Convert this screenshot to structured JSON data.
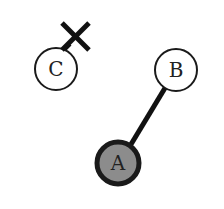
{
  "diagram": {
    "nodes": [
      {
        "id": "C",
        "label": "C",
        "cx": 56,
        "cy": 69,
        "r": 22,
        "fill": "#ffffff",
        "stroke": "#1a1a1a",
        "stroke_width": 2
      },
      {
        "id": "B",
        "label": "B",
        "cx": 176,
        "cy": 70,
        "r": 21,
        "fill": "#ffffff",
        "stroke": "#1a1a1a",
        "stroke_width": 2
      },
      {
        "id": "A",
        "label": "A",
        "cx": 118,
        "cy": 163,
        "r": 21,
        "fill": "#8c8c8c",
        "stroke": "#1a1a1a",
        "stroke_width": 5
      }
    ],
    "edges": [
      {
        "from": "A",
        "to": "B",
        "stroke": "#111111",
        "stroke_width": 5
      }
    ],
    "markers": [
      {
        "type": "cross",
        "near": "C",
        "cx": 76,
        "cy": 36,
        "size": 14,
        "stroke": "#111111",
        "stroke_width": 5
      }
    ]
  }
}
